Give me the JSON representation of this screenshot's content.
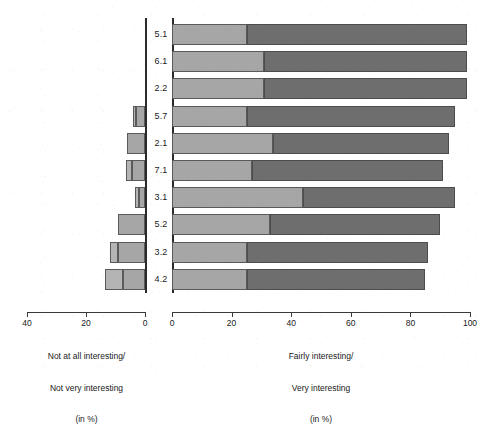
{
  "chart_data": {
    "type": "bar",
    "subtype": "diverging-stacked-horizontal",
    "title": "",
    "categories": [
      "5.1",
      "6.1",
      "2.2",
      "5.7",
      "2.1",
      "7.1",
      "3.1",
      "5.2",
      "3.2",
      "4.2"
    ],
    "left_axis": {
      "label_lines": [
        "Not at all interesting/",
        "Not very interesting",
        "(in %)"
      ],
      "ticks": [
        40,
        20,
        0
      ],
      "tick_labels": [
        "40",
        "20",
        "0"
      ],
      "range": [
        40,
        0
      ],
      "reversed": true
    },
    "right_axis": {
      "label_lines": [
        "Fairly interesting/",
        "Very interesting",
        "(in %)"
      ],
      "ticks": [
        0,
        20,
        40,
        60,
        80,
        100
      ],
      "tick_labels": [
        "0",
        "20",
        "40",
        "60",
        "80",
        "100"
      ],
      "range": [
        0,
        100
      ],
      "reversed": false
    },
    "series": [
      {
        "name": "Not at all interesting",
        "side": "left",
        "color": "#b4b4b4",
        "values": [
          0,
          0,
          0,
          1,
          0,
          2,
          1.5,
          0,
          3,
          6
        ]
      },
      {
        "name": "Not very interesting",
        "side": "left",
        "color": "#a6a6a6",
        "values": [
          0,
          0,
          0,
          3,
          6,
          4.5,
          2,
          9,
          9,
          7.5
        ]
      },
      {
        "name": "Fairly interesting",
        "side": "right",
        "color": "#a6a6a6",
        "values": [
          25,
          31,
          31,
          25,
          34,
          27,
          44,
          33,
          25,
          25
        ]
      },
      {
        "name": "Very interesting",
        "side": "right",
        "color": "#6e6e6e",
        "values": [
          74,
          68,
          68,
          70,
          59,
          64,
          51,
          57,
          61,
          60
        ]
      }
    ],
    "grid": false,
    "legend": "none",
    "colors": {
      "light_gray": "#b4b4b4",
      "mid_gray": "#a6a6a6",
      "dark_gray": "#6e6e6e",
      "outline": "#5a5a5a",
      "axis": "#3a3a3a",
      "baseline": "#2b2b2b",
      "background": "#ffffff"
    }
  }
}
